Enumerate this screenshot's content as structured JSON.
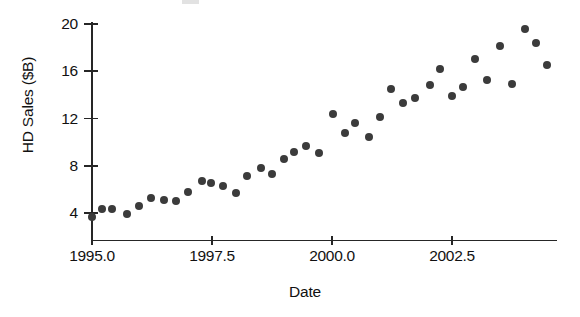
{
  "figure": {
    "background": "#ffffff",
    "point_color": "#3b3b3b",
    "axis_color": "#262626"
  },
  "axes": {
    "y_title": "HD Sales ($B)",
    "x_title": "Date",
    "y_ticks": [
      {
        "label": "4",
        "value": 4
      },
      {
        "label": "8",
        "value": 8
      },
      {
        "label": "12",
        "value": 12
      },
      {
        "label": "16",
        "value": 16
      },
      {
        "label": "20",
        "value": 20
      }
    ],
    "x_ticks": [
      {
        "label": "1995.0",
        "value": 1995.0
      },
      {
        "label": "1997.5",
        "value": 1997.5
      },
      {
        "label": "2000.0",
        "value": 2000.0
      },
      {
        "label": "2002.5",
        "value": 2002.5
      }
    ]
  },
  "chart_data": {
    "type": "scatter",
    "title": "",
    "xlabel": "Date",
    "ylabel": "HD Sales ($B)",
    "xlim": [
      1994.8,
      2004.6
    ],
    "ylim": [
      2.7,
      20.9
    ],
    "grid": false,
    "legend": null,
    "marker": "filled-circle",
    "x": [
      1995.0,
      1995.21,
      1995.42,
      1995.73,
      1995.98,
      1996.23,
      1996.5,
      1996.75,
      1997.0,
      1997.29,
      1997.48,
      1997.73,
      1998.0,
      1998.23,
      1998.52,
      1998.75,
      1999.0,
      1999.21,
      1999.46,
      1999.73,
      2000.02,
      2000.27,
      2000.48,
      2000.77,
      2001.0,
      2001.23,
      2001.48,
      2001.73,
      2002.04,
      2002.25,
      2002.5,
      2002.73,
      2002.98,
      2003.23,
      2003.5,
      2003.75,
      2004.02,
      2004.25,
      2004.48
    ],
    "y": [
      3.7,
      4.3,
      4.3,
      3.9,
      4.6,
      5.3,
      5.1,
      5.0,
      5.8,
      6.7,
      6.5,
      6.3,
      5.7,
      7.1,
      7.8,
      7.3,
      8.6,
      9.2,
      9.7,
      9.1,
      12.4,
      10.8,
      11.6,
      10.4,
      12.1,
      14.5,
      13.3,
      13.7,
      14.8,
      16.2,
      13.9,
      14.7,
      17.0,
      15.3,
      18.1,
      14.9,
      19.6,
      18.4,
      16.5
    ]
  }
}
